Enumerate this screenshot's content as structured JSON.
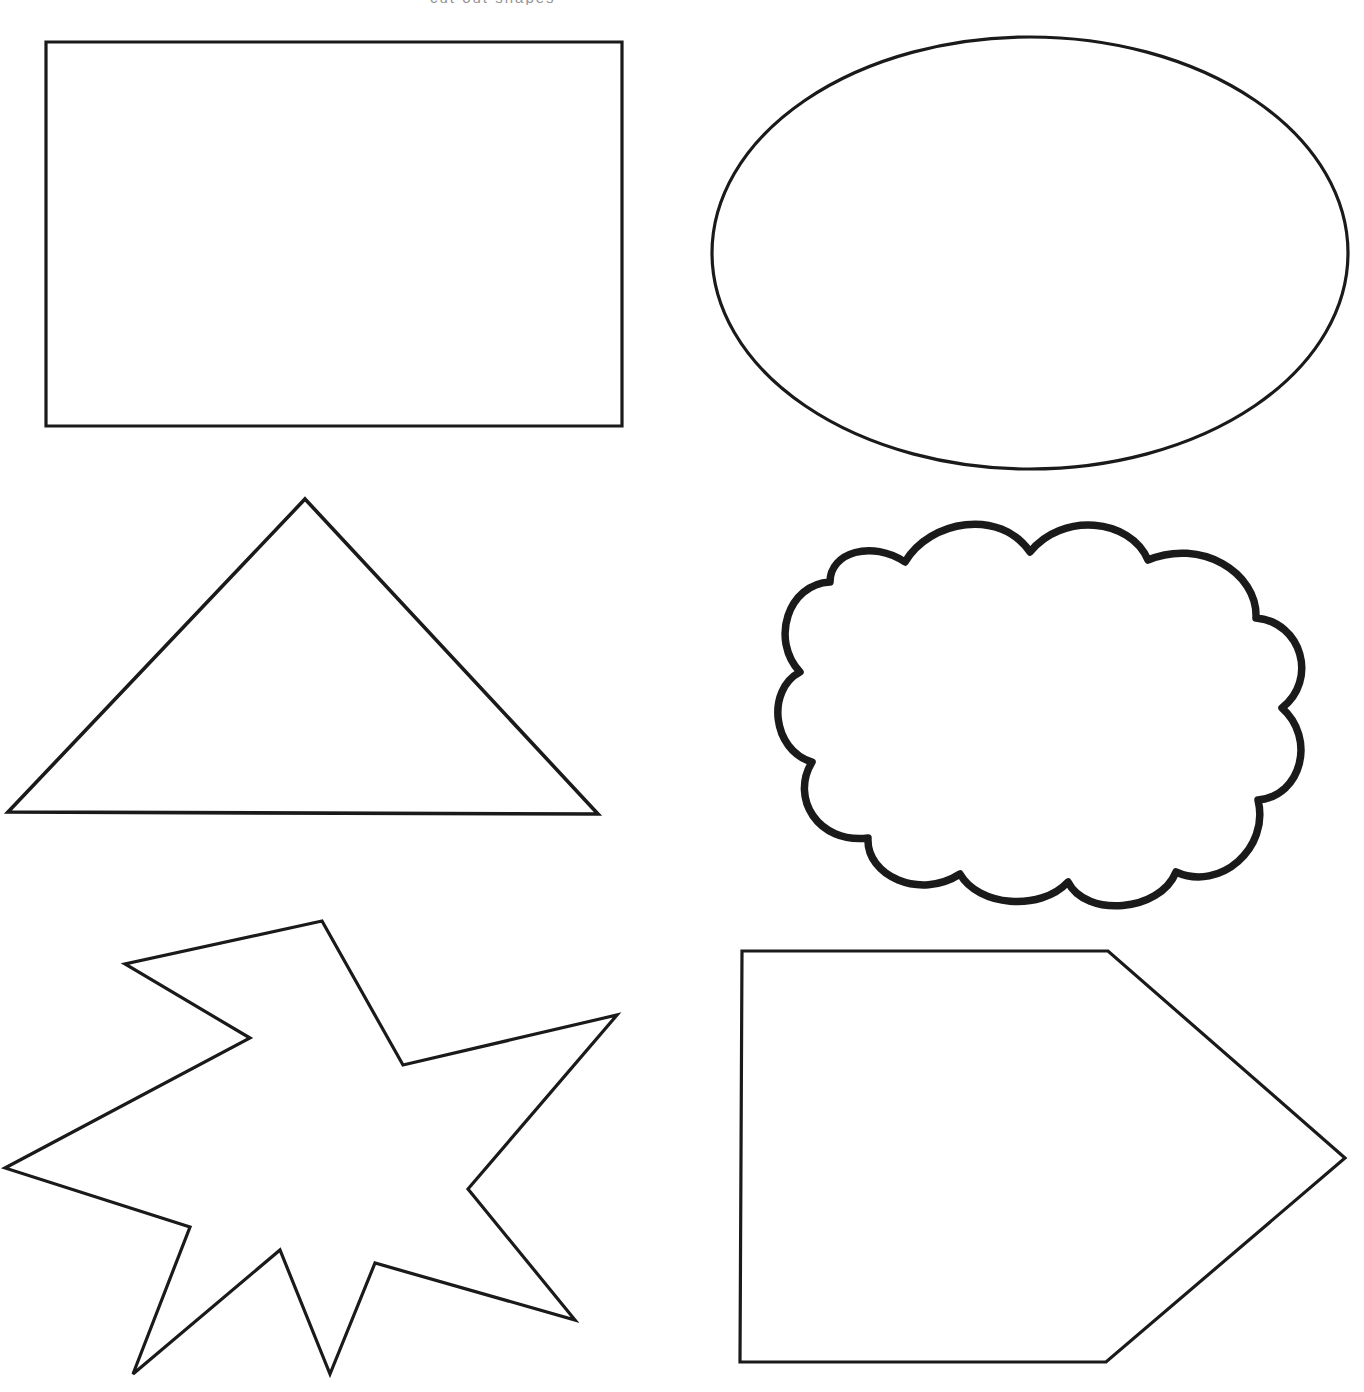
{
  "page": {
    "background_color": "#ffffff",
    "stroke_color": "#1a1a1a",
    "width": 1364,
    "height": 1392,
    "clipped_header_text": "cut out shapes"
  },
  "shapes": [
    {
      "id": "rectangle",
      "name": "Rectangle",
      "row": 1,
      "column": "left",
      "stroke_weight": "thin",
      "bounds": {
        "x": 46,
        "y": 42,
        "width": 576,
        "height": 384
      },
      "points": "46,42 622,42 622,426 46,426"
    },
    {
      "id": "ellipse",
      "name": "Ellipse",
      "row": 1,
      "column": "right",
      "stroke_weight": "thin",
      "bounds": {
        "x": 712,
        "y": 37,
        "width": 636,
        "height": 433
      },
      "center": {
        "cx": 1030,
        "cy": 253
      },
      "radii": {
        "rx": 318,
        "ry": 216
      }
    },
    {
      "id": "triangle",
      "name": "Triangle",
      "row": 2,
      "column": "left",
      "stroke_weight": "medium",
      "bounds": {
        "x": 8,
        "y": 499,
        "width": 590,
        "height": 316
      },
      "points": "305,499 598,814 8,812"
    },
    {
      "id": "cloud",
      "name": "Cloud",
      "row": 2,
      "column": "right",
      "stroke_weight": "thick",
      "bounds": {
        "x": 765,
        "y": 512,
        "width": 535,
        "height": 388
      },
      "path": "M 905,562 C 930,520 1000,508 1030,552 C 1062,512 1130,518 1148,560 C 1200,538 1258,572 1256,618 C 1302,622 1318,680 1282,708 C 1316,738 1302,796 1258,800 C 1270,848 1220,892 1176,872 C 1160,912 1086,918 1068,882 C 1040,912 978,906 960,874 C 920,900 866,876 868,838 C 818,844 790,798 812,762 C 772,750 766,690 800,672 C 770,640 788,584 830,582 C 830,552 872,540 905,562 Z"
    },
    {
      "id": "star",
      "name": "Seven-pointed star",
      "row": 3,
      "column": "left",
      "stroke_weight": "thin",
      "bounds": {
        "x": 5,
        "y": 921,
        "width": 612,
        "height": 455
      },
      "points": "322,921 403,1065 617,1015 468,1189 575,1320 375,1263 330,1374 280,1250 133,1374 190,1227 5,1168 250,1038 125,964"
    },
    {
      "id": "pentagon-arrow",
      "name": "Home plate pentagon",
      "row": 3,
      "column": "right",
      "stroke_weight": "thin",
      "bounds": {
        "x": 740,
        "y": 951,
        "width": 608,
        "height": 411
      },
      "points": "742,951 1108,951 1345,1158 1106,1362 740,1362"
    }
  ]
}
